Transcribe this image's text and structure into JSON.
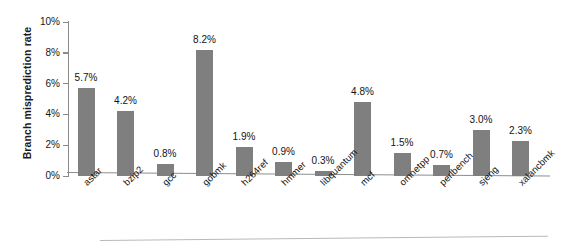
{
  "chart_data": {
    "type": "bar",
    "title": "",
    "xlabel": "",
    "ylabel": "Branch misprediction rate",
    "ylim": [
      0,
      10
    ],
    "ytick_labels": [
      "0%",
      "2%",
      "4%",
      "6%",
      "8%",
      "10%"
    ],
    "ytick_values": [
      0,
      2,
      4,
      6,
      8,
      10
    ],
    "grid": false,
    "legend": null,
    "value_label_suffix": "%",
    "bar_color": "#7f7f7f",
    "axis_color": "#8a8a8a",
    "categories": [
      "astar",
      "bzip2",
      "gcc",
      "gobmk",
      "h264ref",
      "hmmer",
      "libquantum",
      "mcf",
      "omnetpp",
      "perlbench",
      "sjeng",
      "xalancbmk"
    ],
    "values": [
      5.7,
      4.2,
      0.8,
      8.2,
      1.9,
      0.9,
      0.3,
      4.8,
      1.5,
      0.7,
      3.0,
      2.3
    ],
    "value_labels": [
      "5.7%",
      "4.2%",
      "0.8%",
      "8.2%",
      "1.9%",
      "0.9%",
      "0.3%",
      "4.8%",
      "1.5%",
      "0.7%",
      "3.0%",
      "2.3%"
    ]
  }
}
